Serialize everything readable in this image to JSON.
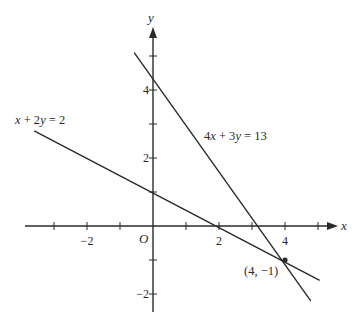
{
  "chart_data": {
    "type": "line",
    "title": "",
    "xlabel": "x",
    "ylabel": "y",
    "origin_label": "O",
    "xlim": [
      -3.9,
      5.6
    ],
    "ylim": [
      -2.8,
      5.9
    ],
    "grid": false,
    "x_ticks": [
      -3,
      -2,
      -1,
      1,
      2,
      3,
      4,
      5
    ],
    "x_tick_labels": [
      {
        "value": -2,
        "text": "−2"
      },
      {
        "value": 2,
        "text": "2"
      },
      {
        "value": 4,
        "text": "4"
      }
    ],
    "y_ticks": [
      -2,
      -1,
      1,
      2,
      3,
      4,
      5
    ],
    "y_tick_labels": [
      {
        "value": 4,
        "text": "4"
      },
      {
        "value": 2,
        "text": "2"
      },
      {
        "value": -2,
        "text": "−2"
      }
    ],
    "series": [
      {
        "name": "4x + 3y = 13",
        "equation": "4x + 3y = 13",
        "x": [
          -0.57,
          4.78
        ],
        "y": [
          5.1,
          -2.2
        ]
      },
      {
        "name": "x + 2y = 2",
        "equation": "x + 2y = 2",
        "x": [
          -3.6,
          5.05
        ],
        "y": [
          2.8,
          -1.6
        ]
      }
    ],
    "annotations": [
      {
        "text": "(4, −1)",
        "x": 4,
        "y": -1,
        "marker": "point"
      },
      {
        "text": "x + 2y = 2",
        "attached_to": "x + 2y = 2"
      },
      {
        "text": "4x + 3y = 13",
        "attached_to": "4x + 3y = 13"
      }
    ],
    "intersection": {
      "x": 4,
      "y": -1,
      "label": "(4, −1)"
    }
  },
  "labels": {
    "x_axis": "x",
    "y_axis": "y",
    "origin": "O",
    "eq1": "x + 2y = 2",
    "eq2": "4x + 3y = 13",
    "point": "(4, −1)"
  },
  "colors": {
    "ink": "#2a2a2a",
    "background": "#ffffff"
  }
}
